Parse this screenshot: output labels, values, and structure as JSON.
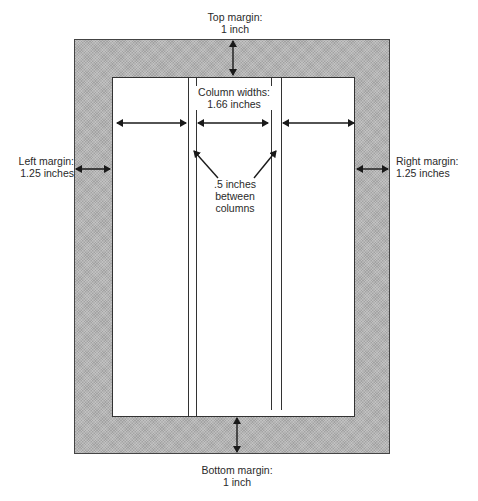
{
  "diagram": {
    "labels": {
      "top_margin": [
        "Top margin:",
        "1 inch"
      ],
      "bottom_margin": [
        "Bottom margin:",
        "1 inch"
      ],
      "left_margin": [
        "Left margin:",
        "1.25 inches"
      ],
      "right_margin": [
        "Right margin:",
        "1.25 inches"
      ],
      "column_widths": [
        "Column widths:",
        "1.66 inches"
      ],
      "gutter": [
        ".5 inches",
        "between",
        "columns"
      ]
    },
    "colors": {
      "margin_fill": "#b4b4b4",
      "page_fill": "#ffffff",
      "stroke": "#222222"
    },
    "columns": 3
  }
}
